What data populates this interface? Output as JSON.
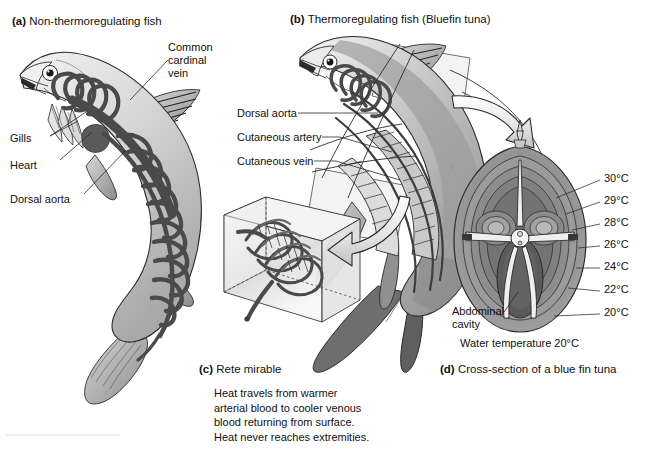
{
  "figure": {
    "background": "#ffffff",
    "ink": "#111111"
  },
  "panels": {
    "a": {
      "tag": "(a)",
      "title": "Non-thermoregulating fish",
      "labels": [
        {
          "name": "common-cardinal-vein",
          "text": "Common\ncardinal\nvein"
        },
        {
          "name": "gills",
          "text": "Gills"
        },
        {
          "name": "heart",
          "text": "Heart"
        },
        {
          "name": "dorsal-aorta",
          "text": "Dorsal aorta"
        }
      ]
    },
    "b": {
      "tag": "(b)",
      "title": "Thermoregulating fish (Bluefin tuna)",
      "labels": [
        {
          "name": "dorsal-aorta",
          "text": "Dorsal aorta"
        },
        {
          "name": "cutaneous-artery",
          "text": "Cutaneous artery"
        },
        {
          "name": "cutaneous-vein",
          "text": "Cutaneous vein"
        }
      ]
    },
    "c": {
      "tag": "(c)",
      "title": "Rete mirable",
      "caption": "Heat travels from warmer\narterial blood to cooler venous\nblood returning from surface.\nHeat never reaches extremities."
    },
    "d": {
      "tag": "(d)",
      "title": "Cross-section of a blue fin tuna",
      "abdominal_cavity_label": "Abdominal\ncavity",
      "water_temperature_label": "Water temperature 20°C",
      "isotherms": [
        {
          "value": "30°C",
          "y": 178
        },
        {
          "value": "29°C",
          "y": 200
        },
        {
          "value": "28°C",
          "y": 222
        },
        {
          "value": "26°C",
          "y": 244
        },
        {
          "value": "24°C",
          "y": 266
        },
        {
          "value": "22°C",
          "y": 289
        },
        {
          "value": "20°C",
          "y": 312
        }
      ]
    }
  },
  "palette": {
    "vessel_dark": "#4a4a4a",
    "body_light": "#e8e8e8",
    "body_mid": "#b9b9b9",
    "body_shade": "#8f8f8f",
    "contour_1": "#9a9a9a",
    "contour_2": "#8a8a8a",
    "contour_3": "#7a7a7a",
    "contour_4": "#6c6c6c",
    "contour_5": "#5e5e5e",
    "outline": "#2b2b2b"
  },
  "icons": {
    "flow_arrow_to_crosssection": "curved-arrow-icon",
    "flow_arrow_to_rete": "curved-arrow-icon"
  }
}
